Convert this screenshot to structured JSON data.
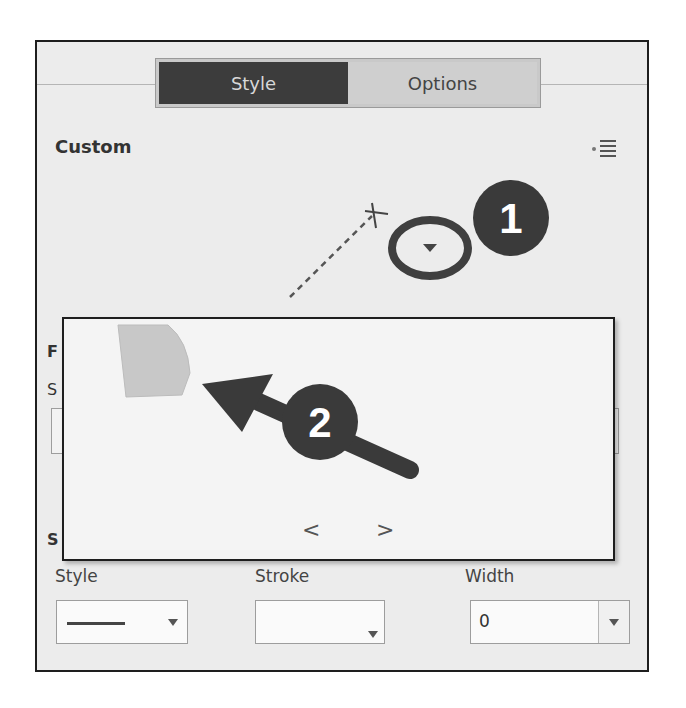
{
  "tabs": [
    {
      "label": "Style",
      "active": true
    },
    {
      "label": "Options",
      "active": false
    }
  ],
  "section": {
    "title": "Custom",
    "menu_icon": "panel-menu-icon"
  },
  "canvas": {
    "anchor_marker": "x-marker-icon",
    "dropdown_icon": "triangle-down-icon"
  },
  "callouts": [
    {
      "number": "1",
      "target": "shape-dropdown-trigger"
    },
    {
      "number": "2",
      "target": "shape-thumbnail"
    }
  ],
  "popup": {
    "thumbnails": [
      {
        "name": "custom-shape",
        "color": "#c8c8c8"
      }
    ],
    "prev_label": "<",
    "next_label": ">"
  },
  "occluded_labels": {
    "left_1": "F",
    "left_2": "S",
    "left_3": "S"
  },
  "stroke_section": {
    "fields": [
      {
        "label": "Style",
        "value": "solid-line"
      },
      {
        "label": "Stroke",
        "value": ""
      },
      {
        "label": "Width",
        "value": "0"
      }
    ]
  },
  "colors": {
    "panel_bg": "#ececec",
    "active_tab": "#3c3c3c",
    "callout": "#3a3a3a"
  }
}
